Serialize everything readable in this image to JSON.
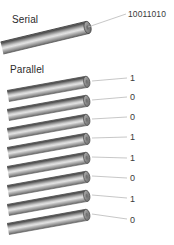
{
  "figure": {
    "title_serial": "Serial",
    "title_parallel": "Parallel",
    "serial_word": "10011010",
    "background_color": "#ffffff",
    "cable_color_light": "#d8d8d8",
    "cable_color_mid": "#9a9a9a",
    "cable_color_dark": "#4d4d4d",
    "leader_color": "#b9b9b9",
    "text_color": "#3a3a3a"
  },
  "serial": {
    "label": "Serial",
    "bits_string": "10011010"
  },
  "parallel": {
    "label": "Parallel",
    "lines": [
      {
        "index": 0,
        "bit": "1"
      },
      {
        "index": 1,
        "bit": "0"
      },
      {
        "index": 2,
        "bit": "0"
      },
      {
        "index": 3,
        "bit": "1"
      },
      {
        "index": 4,
        "bit": "1"
      },
      {
        "index": 5,
        "bit": "0"
      },
      {
        "index": 6,
        "bit": "1"
      },
      {
        "index": 7,
        "bit": "0"
      }
    ]
  }
}
